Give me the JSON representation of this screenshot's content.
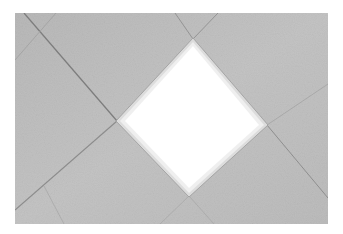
{
  "image": {
    "description": "Ceiling with diagonally laid acoustic tiles and a diamond-shaped recessed light panel",
    "background_color": "#ffffff",
    "photo_bounds": {
      "x": 15,
      "y": 13,
      "width": 313,
      "height": 211
    },
    "tile_color": "#bdbdbd",
    "tile_color_light": "#c8c8c8",
    "grid_line_color": "#8a8a8a",
    "light_panel": {
      "fill": "#ffffff",
      "frame_color": "#e4e4e4",
      "vertices": {
        "top": [
          193,
          39
        ],
        "right": [
          267,
          125
        ],
        "bottom": [
          189,
          196
        ],
        "left": [
          117,
          121
        ]
      }
    },
    "grid_lines": [
      {
        "from": [
          24,
          13
        ],
        "to": [
          117,
          121
        ],
        "weight": "strong"
      },
      {
        "from": [
          15,
          60
        ],
        "to": [
          56,
          13
        ],
        "weight": "faint"
      },
      {
        "from": [
          15,
          210
        ],
        "to": [
          117,
          121
        ],
        "weight": "medium"
      },
      {
        "from": [
          44,
          186
        ],
        "to": [
          64,
          224
        ],
        "weight": "faint"
      },
      {
        "from": [
          175,
          13
        ],
        "to": [
          193,
          39
        ],
        "weight": "medium"
      },
      {
        "from": [
          218,
          13
        ],
        "to": [
          193,
          39
        ],
        "weight": "medium"
      },
      {
        "from": [
          267,
          125
        ],
        "to": [
          328,
          198
        ],
        "weight": "medium"
      },
      {
        "from": [
          267,
          125
        ],
        "to": [
          328,
          84
        ],
        "weight": "faint"
      },
      {
        "from": [
          189,
          196
        ],
        "to": [
          160,
          224
        ],
        "weight": "faint"
      },
      {
        "from": [
          189,
          196
        ],
        "to": [
          214,
          224
        ],
        "weight": "faint"
      }
    ]
  }
}
